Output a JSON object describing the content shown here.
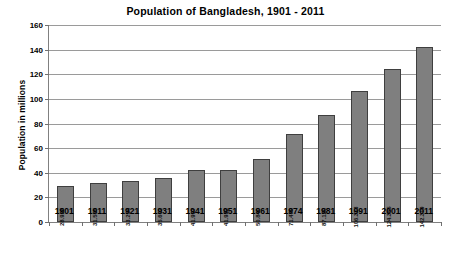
{
  "chart_data": {
    "type": "bar",
    "title": "Population of Bangladesh, 1901 - 2011",
    "xlabel": "",
    "ylabel": "Population in millions",
    "categories": [
      "1901",
      "1911",
      "1921",
      "1931",
      "1941",
      "1951",
      "1961",
      "1974",
      "1981",
      "1991",
      "2001",
      "2011"
    ],
    "values": [
      28.928,
      31.555,
      33.254,
      35.602,
      41.997,
      41.932,
      50.84,
      71.479,
      87.12,
      106.313,
      124.355,
      142.319
    ],
    "value_labels": [
      "28.928",
      "31.555",
      "33.254",
      "35.602",
      "41.997",
      "41.932",
      "50.840",
      "71.479",
      "87.120",
      "106.313",
      "124.355",
      "142.319"
    ],
    "ylim": [
      0,
      160
    ],
    "y_ticks": [
      0,
      20,
      40,
      60,
      80,
      100,
      120,
      140,
      160
    ],
    "y_tick_labels": [
      "0",
      "20",
      "40",
      "60",
      "80",
      "100",
      "120",
      "140",
      "160"
    ],
    "grid": true,
    "grid_axis": "y",
    "legend": false,
    "legend_position": "none",
    "bar_color": "#7f7f7f",
    "bar_border_color": "#3f3f3f",
    "gridline_color": "#9a9a9a",
    "axis_color": "#808080",
    "background_color": "#ffffff",
    "text_color": "#000000",
    "value_label_rotation": -90,
    "value_label_position": "inside-bottom"
  }
}
